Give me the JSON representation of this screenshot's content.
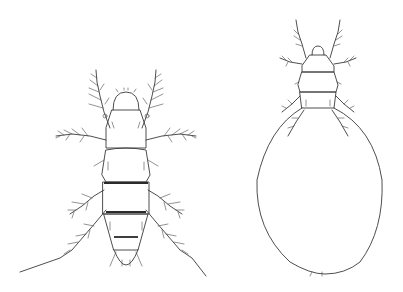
{
  "figure": {
    "background": "#ffffff",
    "line_color": "#3a3a3a",
    "specimens": [
      {
        "id": "left",
        "description": "mite, dorsal view, normal body"
      },
      {
        "id": "right",
        "description": "mite, dorsal view, physogastric swollen body"
      }
    ]
  }
}
